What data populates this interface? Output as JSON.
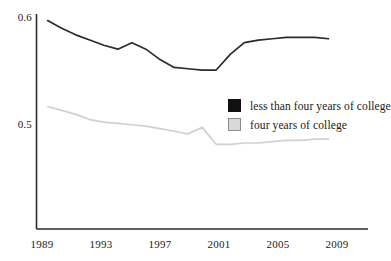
{
  "chart_data": {
    "type": "line",
    "title": "",
    "xlabel": "",
    "ylabel": "",
    "x": [
      1989,
      1990,
      1991,
      1992,
      1993,
      1994,
      1995,
      1996,
      1997,
      1998,
      1999,
      2000,
      2001,
      2002,
      2003,
      2004,
      2005,
      2006,
      2007,
      2008,
      2009
    ],
    "xlim": [
      1988.6,
      2009.6
    ],
    "ylim": [
      0.44,
      0.605
    ],
    "grid": false,
    "legend_position": "inside-right",
    "yticks": [
      0.5,
      0.6
    ],
    "ytick_labels": [
      "0.5",
      "0.6"
    ],
    "xticks": [
      1989,
      1993,
      1997,
      2001,
      2005,
      2009
    ],
    "xtick_labels": [
      "1989",
      "1993",
      "1997",
      "2001",
      "2005",
      "2009"
    ],
    "series": [
      {
        "name": "less than four years of college",
        "color": "#2b2b2b",
        "swatch": "dark",
        "values": [
          0.6,
          0.594,
          0.589,
          0.585,
          0.581,
          0.578,
          0.583,
          0.578,
          0.57,
          0.564,
          0.563,
          0.562,
          0.562,
          0.574,
          0.583,
          0.585,
          0.586,
          0.587,
          0.587,
          0.587,
          0.586
        ]
      },
      {
        "name": "four years of college",
        "color": "#d0d0d0",
        "swatch": "light",
        "values": [
          0.534,
          0.531,
          0.528,
          0.524,
          0.522,
          0.521,
          0.52,
          0.519,
          0.517,
          0.515,
          0.513,
          0.518,
          0.505,
          0.505,
          0.506,
          0.506,
          0.507,
          0.508,
          0.508,
          0.509,
          0.509
        ]
      }
    ]
  },
  "axes": {
    "y_labels": [
      {
        "text": "0.6",
        "left": 4,
        "top": 11
      },
      {
        "text": "0.5",
        "left": 4,
        "top": 118
      }
    ],
    "x_labels": [
      {
        "text": "1989",
        "left": 22,
        "top": 238
      },
      {
        "text": "1993",
        "left": 81,
        "top": 238
      },
      {
        "text": "1997",
        "left": 140,
        "top": 238
      },
      {
        "text": "2001",
        "left": 199,
        "top": 238
      },
      {
        "text": "2005",
        "left": 258,
        "top": 238
      },
      {
        "text": "2009",
        "left": 317,
        "top": 238
      }
    ]
  },
  "legend": {
    "items": [
      {
        "label": "less than four years of college",
        "swatch": "dark"
      },
      {
        "label": "four years of college",
        "swatch": "light"
      }
    ]
  }
}
